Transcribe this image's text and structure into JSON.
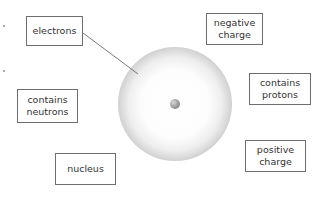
{
  "diagram": {
    "type": "atom-labelling",
    "labels": {
      "electrons": "electrons",
      "negative_charge": "negative\ncharge",
      "contains_protons": "contains\nprotons",
      "contains_neutrons": "contains\nneutrons",
      "nucleus": "nucleus",
      "positive_charge": "positive\ncharge"
    },
    "connector": {
      "from_label": "electrons",
      "to": "electron-cloud"
    },
    "colors": {
      "box_border": "#6e6e6e",
      "text": "#333333",
      "cloud_edge": "#bdbdbd",
      "nucleus": "#9a9a9a"
    }
  }
}
